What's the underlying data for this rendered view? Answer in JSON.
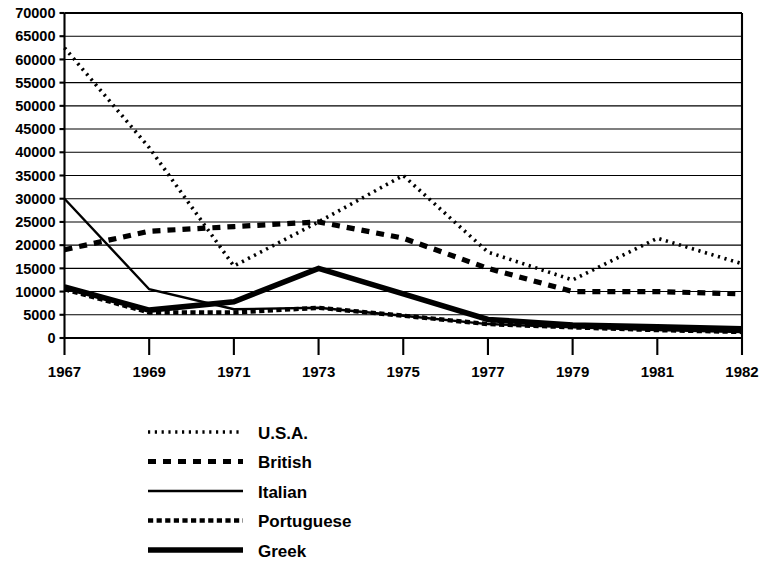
{
  "chart_data": {
    "type": "line",
    "title": "",
    "subtitle": "",
    "xlabel": "",
    "ylabel": "",
    "grid": true,
    "legend_position": "bottom-left",
    "x": [
      "1967",
      "1969",
      "1971",
      "1973",
      "1975",
      "1977",
      "1979",
      "1981",
      "1982"
    ],
    "xtick_labels": [
      "1967",
      "1969",
      "1971",
      "1973",
      "1975",
      "1977",
      "1979",
      "1981",
      "1982"
    ],
    "ytick_labels": [
      "70000",
      "65000",
      "60000",
      "55000",
      "50000",
      "45000",
      "40000",
      "35000",
      "30000",
      "25000",
      "20000",
      "15000",
      "10000",
      "5000",
      "0"
    ],
    "ytick_values": [
      70000,
      65000,
      60000,
      55000,
      50000,
      45000,
      40000,
      35000,
      30000,
      25000,
      20000,
      15000,
      10000,
      5000,
      0
    ],
    "ylim": [
      0,
      70000
    ],
    "ystep": 5000,
    "series": [
      {
        "name": "U.S.A.",
        "style": "fine-dotted",
        "dasharray": "2.2 4.6",
        "width": 3.6,
        "values": [
          62500,
          41000,
          15500,
          25000,
          35000,
          18500,
          12500,
          21500,
          16000
        ]
      },
      {
        "name": "British",
        "style": "thick-dashed",
        "dasharray": "8 7",
        "width": 5.2,
        "values": [
          19000,
          23000,
          24000,
          25000,
          21500,
          15000,
          10000,
          10000,
          9500
        ]
      },
      {
        "name": "Italian",
        "style": "thin-solid",
        "dasharray": "none",
        "width": 2.4,
        "values": [
          30000,
          10500,
          6200,
          6500,
          4800,
          3000,
          2300,
          1700,
          1300
        ]
      },
      {
        "name": "Portuguese",
        "style": "medium-dashed",
        "dasharray": "5.2 3.4",
        "width": 4.4,
        "values": [
          10500,
          5500,
          5500,
          6500,
          4800,
          3000,
          2300,
          1700,
          1300
        ]
      },
      {
        "name": "Greek",
        "style": "thick-solid",
        "dasharray": "none",
        "width": 5.6,
        "values": [
          11000,
          6000,
          7800,
          15000,
          9500,
          4000,
          2800,
          2400,
          2000
        ]
      }
    ],
    "legend": [
      {
        "label": "U.S.A.",
        "style": "fine-dotted"
      },
      {
        "label": "British",
        "style": "thick-dashed"
      },
      {
        "label": "Italian",
        "style": "thin-solid"
      },
      {
        "label": "Portuguese",
        "style": "medium-dashed"
      },
      {
        "label": "Greek",
        "style": "thick-solid"
      }
    ],
    "colors": {
      "ink": "#000000",
      "background": "#ffffff"
    }
  }
}
